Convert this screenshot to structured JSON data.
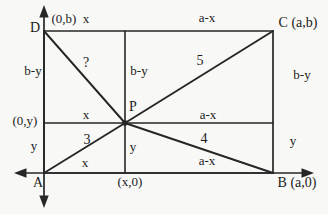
{
  "diagram": {
    "background": "#f8f8f6",
    "line_color": "#262626",
    "text_color": "#1b1b1b"
  },
  "labels": {
    "corner_d": "D",
    "coord_top": "(0,b)",
    "top_left_segment": "x",
    "top_right_segment": "a-x",
    "corner_c": "C (a,b)",
    "left_upper": "b-y",
    "unknown_segment": "?",
    "center_upper": "b-y",
    "segment_pc": "5",
    "right_upper": "b-y",
    "coord_left": "(0,y)",
    "mid_left_segment": "x",
    "point_p": "P",
    "mid_right_segment": "a-x",
    "segment_ap": "3",
    "segment_pb": "4",
    "left_lower": "y",
    "center_lower": "y",
    "right_lower": "y",
    "bottom_left_segment": "x",
    "bottom_right_segment": "a-x",
    "corner_a": "A",
    "coord_bottom": "(x,0)",
    "corner_b": "B (a,0)"
  }
}
